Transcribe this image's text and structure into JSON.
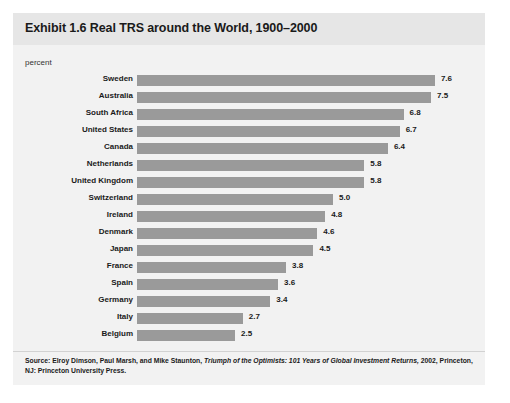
{
  "figure": {
    "title": "Exhibit 1.6 Real TRS around the World, 1900–2000",
    "axis_unit_label": "percent",
    "source_prefix": "Source: Elroy Dimson, Paul Marsh, and Mike Staunton, ",
    "source_italic": "Triumph of the Optimists: 101 Years of Global Investment Returns,",
    "source_suffix": " 2002, Princeton, NJ: Princeton University Press."
  },
  "colors": {
    "panel_background": "#f2f2f2",
    "title_band": "#e6e6e6",
    "bar": "#9a9a9a",
    "text": "#1a1a1a"
  },
  "chart_data": {
    "type": "bar",
    "orientation": "horizontal",
    "title": "Exhibit 1.6 Real TRS around the World, 1900–2000",
    "xlabel": "percent",
    "ylabel": "",
    "xlim": [
      0,
      8
    ],
    "grid": false,
    "legend": "none",
    "categories": [
      "Sweden",
      "Australia",
      "South Africa",
      "United States",
      "Canada",
      "Netherlands",
      "United Kingdom",
      "Switzerland",
      "Ireland",
      "Denmark",
      "Japan",
      "France",
      "Spain",
      "Germany",
      "Italy",
      "Belgium"
    ],
    "values": [
      7.6,
      7.5,
      6.8,
      6.7,
      6.4,
      5.8,
      5.8,
      5.0,
      4.8,
      4.6,
      4.5,
      3.8,
      3.6,
      3.4,
      2.7,
      2.5
    ],
    "value_labels": [
      "7.6",
      "7.5",
      "6.8",
      "6.7",
      "6.4",
      "5.8",
      "5.8",
      "5.0",
      "4.8",
      "4.6",
      "4.5",
      "3.8",
      "3.6",
      "3.4",
      "2.7",
      "2.5"
    ]
  }
}
